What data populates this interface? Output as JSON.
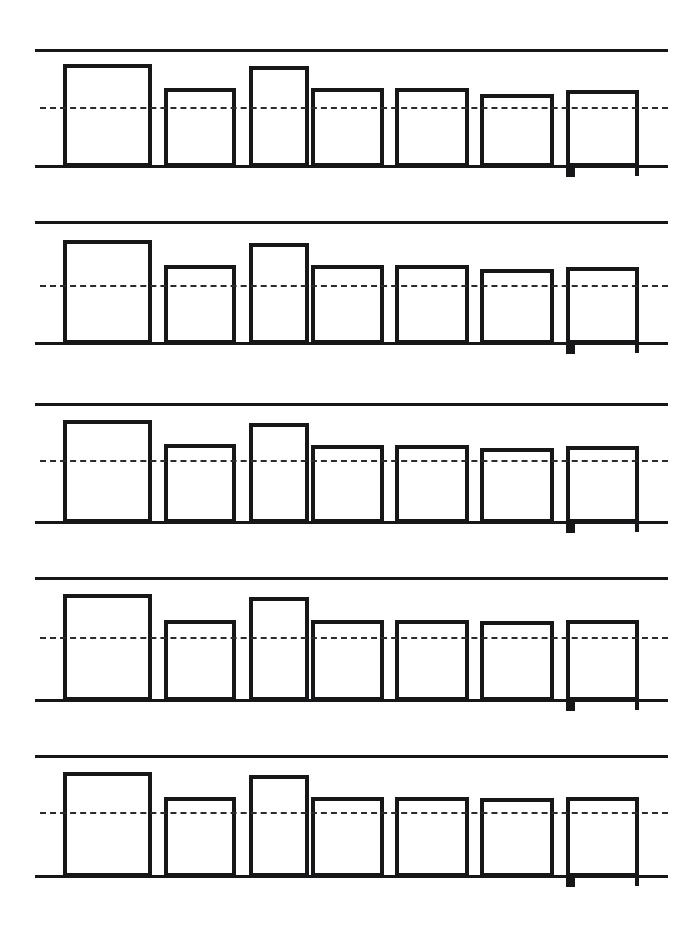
{
  "figure": {
    "title": "",
    "background_color": "#ffffff",
    "ink_color": "#17171a",
    "dash_color": "#2b2b2b",
    "panel_count": 5,
    "bars_per_panel": 7
  },
  "chart_data": {
    "type": "bar",
    "title": "",
    "subtitle": "",
    "xlabel": "",
    "ylabel": "",
    "grid": false,
    "legend_position": "none",
    "axis_tick_labels": [],
    "categories": [
      "1",
      "2",
      "3",
      "4",
      "5",
      "6",
      "7"
    ],
    "ylim": [
      0,
      115
    ],
    "annotations": [
      {
        "name": "reference-dashed-line",
        "style": "dashed",
        "value": 57,
        "span": "full-width"
      },
      {
        "name": "upper-solid-rule",
        "style": "solid",
        "value": 115,
        "span": "full-width"
      },
      {
        "name": "baseline-solid-rule",
        "style": "solid",
        "value": 0,
        "span": "full-width"
      },
      {
        "name": "foot-tick-last-bar",
        "style": "tick",
        "value": -5,
        "span": "bar-7-left-edge"
      }
    ],
    "series": [
      {
        "name": "Panel 1",
        "values": [
          101,
          77,
          97,
          77,
          77,
          71,
          75
        ]
      },
      {
        "name": "Panel 2",
        "values": [
          102,
          78,
          98,
          78,
          78,
          74,
          76
        ]
      },
      {
        "name": "Panel 3",
        "values": [
          100,
          76,
          96,
          76,
          76,
          73,
          75
        ]
      },
      {
        "name": "Panel 4",
        "values": [
          103,
          77,
          99,
          77,
          77,
          76,
          77
        ]
      },
      {
        "name": "Panel 5",
        "values": [
          101,
          76,
          97,
          76,
          76,
          75,
          76
        ]
      }
    ]
  },
  "panels": [
    {
      "name": "panel-1",
      "top_rule_y": 49,
      "baseline_y": 165,
      "dash_y": 107,
      "bars": [
        {
          "name": "bar-1",
          "x": 63,
          "right": 152,
          "top": 64
        },
        {
          "name": "bar-2",
          "x": 164,
          "right": 236,
          "top": 88
        },
        {
          "name": "bar-3",
          "x": 249,
          "right": 309,
          "top": 66
        },
        {
          "name": "bar-4",
          "x": 311,
          "right": 384,
          "top": 88
        },
        {
          "name": "bar-5",
          "x": 395,
          "right": 469,
          "top": 88
        },
        {
          "name": "bar-6",
          "x": 480,
          "right": 554,
          "top": 94
        },
        {
          "name": "bar-7",
          "x": 566,
          "right": 639,
          "top": 90,
          "foot_tick": true
        }
      ]
    },
    {
      "name": "panel-2",
      "top_rule_y": 221,
      "baseline_y": 342,
      "dash_y": 285,
      "bars": [
        {
          "name": "bar-1",
          "x": 63,
          "right": 152,
          "top": 240
        },
        {
          "name": "bar-2",
          "x": 164,
          "right": 236,
          "top": 265
        },
        {
          "name": "bar-3",
          "x": 249,
          "right": 309,
          "top": 243
        },
        {
          "name": "bar-4",
          "x": 311,
          "right": 384,
          "top": 265
        },
        {
          "name": "bar-5",
          "x": 395,
          "right": 469,
          "top": 265
        },
        {
          "name": "bar-6",
          "x": 480,
          "right": 554,
          "top": 269
        },
        {
          "name": "bar-7",
          "x": 566,
          "right": 639,
          "top": 267,
          "foot_tick": true
        }
      ]
    },
    {
      "name": "panel-3",
      "top_rule_y": 403,
      "baseline_y": 521,
      "dash_y": 460,
      "bars": [
        {
          "name": "bar-1",
          "x": 63,
          "right": 152,
          "top": 420
        },
        {
          "name": "bar-2",
          "x": 164,
          "right": 236,
          "top": 444
        },
        {
          "name": "bar-3",
          "x": 249,
          "right": 309,
          "top": 423
        },
        {
          "name": "bar-4",
          "x": 311,
          "right": 384,
          "top": 445
        },
        {
          "name": "bar-5",
          "x": 395,
          "right": 469,
          "top": 445
        },
        {
          "name": "bar-6",
          "x": 480,
          "right": 554,
          "top": 448
        },
        {
          "name": "bar-7",
          "x": 566,
          "right": 639,
          "top": 446,
          "foot_tick": true
        }
      ]
    },
    {
      "name": "panel-4",
      "top_rule_y": 577,
      "baseline_y": 699,
      "dash_y": 637,
      "bars": [
        {
          "name": "bar-1",
          "x": 63,
          "right": 152,
          "top": 594
        },
        {
          "name": "bar-2",
          "x": 164,
          "right": 236,
          "top": 620
        },
        {
          "name": "bar-3",
          "x": 249,
          "right": 309,
          "top": 597
        },
        {
          "name": "bar-4",
          "x": 311,
          "right": 384,
          "top": 620
        },
        {
          "name": "bar-5",
          "x": 395,
          "right": 469,
          "top": 620
        },
        {
          "name": "bar-6",
          "x": 480,
          "right": 554,
          "top": 621
        },
        {
          "name": "bar-7",
          "x": 566,
          "right": 639,
          "top": 620,
          "foot_tick": true
        }
      ]
    },
    {
      "name": "panel-5",
      "top_rule_y": 755,
      "baseline_y": 875,
      "dash_y": 812,
      "bars": [
        {
          "name": "bar-1",
          "x": 63,
          "right": 152,
          "top": 772
        },
        {
          "name": "bar-2",
          "x": 164,
          "right": 236,
          "top": 797
        },
        {
          "name": "bar-3",
          "x": 249,
          "right": 309,
          "top": 775
        },
        {
          "name": "bar-4",
          "x": 311,
          "right": 384,
          "top": 797
        },
        {
          "name": "bar-5",
          "x": 395,
          "right": 469,
          "top": 797
        },
        {
          "name": "bar-6",
          "x": 480,
          "right": 554,
          "top": 798
        },
        {
          "name": "bar-7",
          "x": 566,
          "right": 639,
          "top": 797,
          "foot_tick": true
        }
      ]
    }
  ],
  "geometry": {
    "rule_left": 35,
    "rule_right": 668,
    "rule_thickness": 3,
    "baseline_thickness": 3,
    "dash_left": 40,
    "dash_right": 668
  }
}
